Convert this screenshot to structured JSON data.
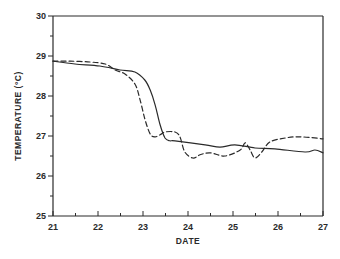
{
  "chart_data": {
    "type": "line",
    "title": "",
    "xlabel": "DATE",
    "ylabel": "TEMPERATURE (°C)",
    "xlim": [
      21,
      27
    ],
    "ylim": [
      25,
      30
    ],
    "x_ticks": [
      21,
      22,
      23,
      24,
      25,
      26,
      27
    ],
    "x_minor_ticks": [
      21.5,
      22.5,
      23.5,
      24.5,
      25.5,
      26.5
    ],
    "y_ticks": [
      25,
      26,
      27,
      28,
      29,
      30
    ],
    "y_minor_ticks": [
      25.5,
      26.5,
      27.5,
      28.5,
      29.5
    ],
    "grid": false,
    "legend": "none",
    "series": [
      {
        "name": "solid",
        "style": "solid",
        "x": [
          21.0,
          21.49,
          22.04,
          22.49,
          22.82,
          23.04,
          23.16,
          23.27,
          23.38,
          23.49,
          23.6,
          23.71,
          24.38,
          24.71,
          25.04,
          25.49,
          25.93,
          26.6,
          26.82,
          27.0
        ],
        "y": [
          28.87,
          28.8,
          28.75,
          28.65,
          28.6,
          28.4,
          28.15,
          27.78,
          27.28,
          26.95,
          26.88,
          26.88,
          26.78,
          26.72,
          26.78,
          26.7,
          26.68,
          26.6,
          26.65,
          26.58
        ]
      },
      {
        "name": "dashed",
        "style": "dashed",
        "x": [
          21.0,
          21.38,
          21.82,
          22.16,
          22.38,
          22.6,
          22.82,
          22.93,
          23.04,
          23.16,
          23.27,
          23.38,
          23.49,
          23.71,
          23.82,
          23.93,
          24.11,
          24.27,
          24.49,
          24.82,
          25.16,
          25.27,
          25.38,
          25.49,
          25.64,
          25.82,
          26.16,
          26.49,
          27.0
        ],
        "y": [
          28.87,
          28.87,
          28.85,
          28.8,
          28.65,
          28.55,
          28.3,
          27.93,
          27.43,
          27.05,
          26.98,
          27.03,
          27.1,
          27.1,
          26.98,
          26.6,
          26.45,
          26.53,
          26.58,
          26.5,
          26.65,
          26.83,
          26.65,
          26.45,
          26.6,
          26.85,
          26.95,
          26.98,
          26.93
        ]
      }
    ]
  }
}
